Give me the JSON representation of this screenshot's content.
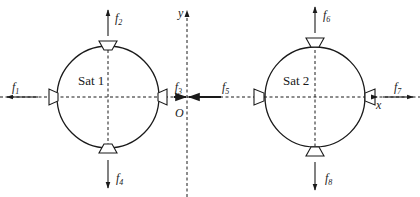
{
  "diagram": {
    "axes": {
      "x_label": "x",
      "y_label": "y",
      "origin_label": "O"
    },
    "satellites": [
      {
        "name": "Sat 1",
        "forces": {
          "left": {
            "label": "f",
            "sub": "1"
          },
          "up": {
            "label": "f",
            "sub": "2"
          },
          "right": {
            "label": "f",
            "sub": "3"
          },
          "down": {
            "label": "f",
            "sub": "4"
          }
        }
      },
      {
        "name": "Sat 2",
        "forces": {
          "left": {
            "label": "f",
            "sub": "5"
          },
          "up": {
            "label": "f",
            "sub": "6"
          },
          "right": {
            "label": "f",
            "sub": "7"
          },
          "down": {
            "label": "f",
            "sub": "8"
          }
        }
      }
    ],
    "colors": {
      "stroke": "#1a1a1a",
      "background": "#ffffff"
    }
  }
}
